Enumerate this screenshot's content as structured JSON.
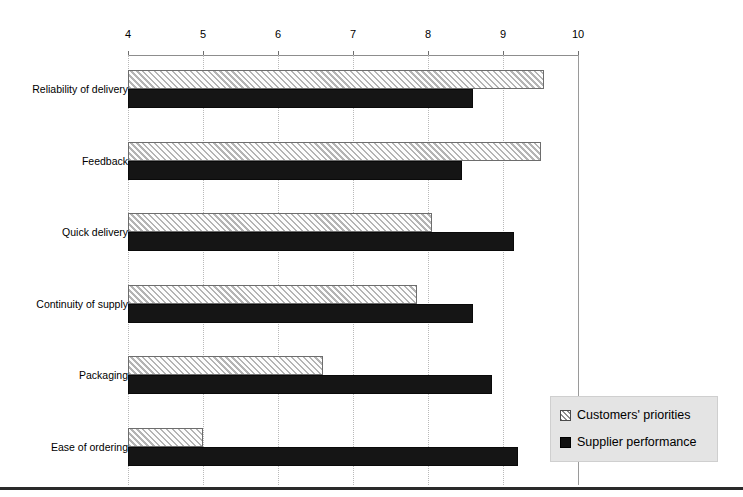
{
  "chart_data": {
    "type": "bar",
    "orientation": "horizontal",
    "title": "",
    "xlabel": "",
    "ylabel": "",
    "xlim": [
      4,
      10
    ],
    "xticks": [
      4,
      5,
      6,
      7,
      8,
      9,
      10
    ],
    "xtick_labels": [
      "4",
      "5",
      "6",
      "7",
      "8",
      "9",
      "10"
    ],
    "grid": true,
    "legend_position": "bottom-right",
    "categories": [
      "Reliability of delivery",
      "Feedback",
      "Quick delivery",
      "Continuity of supply",
      "Packaging",
      "Ease of ordering"
    ],
    "series": [
      {
        "name": "Customers' priorities",
        "pattern": "diagonal-hatch",
        "color": "#e9e9e9",
        "values": [
          9.55,
          9.5,
          8.05,
          7.85,
          6.6,
          5.0
        ]
      },
      {
        "name": "Supplier performance",
        "pattern": "solid",
        "color": "#151515",
        "values": [
          8.6,
          8.45,
          9.15,
          8.6,
          8.85,
          9.2
        ]
      }
    ]
  },
  "legend": {
    "items": [
      {
        "label": "Customers' priorities",
        "swatch": "hatched-square-icon"
      },
      {
        "label": "Supplier performance",
        "swatch": "filled-square-icon"
      }
    ]
  }
}
